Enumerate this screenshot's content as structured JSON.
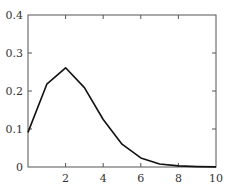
{
  "chart_data": {
    "type": "line",
    "title": "",
    "xlabel": "",
    "ylabel": "",
    "xlim": [
      0,
      10
    ],
    "ylim": [
      0,
      0.4
    ],
    "grid": false,
    "legend": null,
    "x_ticks": [
      {
        "value": 2,
        "label": "2"
      },
      {
        "value": 4,
        "label": "4"
      },
      {
        "value": 6,
        "label": "6"
      },
      {
        "value": 8,
        "label": "8"
      },
      {
        "value": 10,
        "label": "10"
      }
    ],
    "y_ticks": [
      {
        "value": 0,
        "label": "0"
      },
      {
        "value": 0.1,
        "label": "0.1"
      },
      {
        "value": 0.2,
        "label": "0.2"
      },
      {
        "value": 0.3,
        "label": "0.3"
      },
      {
        "value": 0.4,
        "label": "0.4"
      }
    ],
    "series": [
      {
        "name": "pmf",
        "color": "#111111",
        "x": [
          0,
          1,
          2,
          3,
          4,
          5,
          6,
          7,
          8,
          9,
          10
        ],
        "values": [
          0.091,
          0.218,
          0.261,
          0.209,
          0.125,
          0.06,
          0.024,
          0.008,
          0.003,
          0.001,
          0.0002
        ]
      }
    ]
  },
  "layout": {
    "plot_left": 28,
    "plot_right": 216,
    "plot_top": 15,
    "plot_bottom": 167,
    "axis_color": "#555555"
  }
}
